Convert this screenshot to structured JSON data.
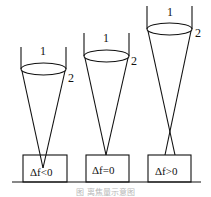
{
  "figure": {
    "type": "laser focus position diagram",
    "panels": [
      {
        "lens_label": "1",
        "beam_label": "2",
        "condition": "Δf<0"
      },
      {
        "lens_label": "1",
        "beam_label": "2",
        "condition": "Δf=0"
      },
      {
        "lens_label": "1",
        "beam_label": "2",
        "condition": "Δf>0"
      }
    ],
    "caption": "图 离焦量示意图"
  }
}
